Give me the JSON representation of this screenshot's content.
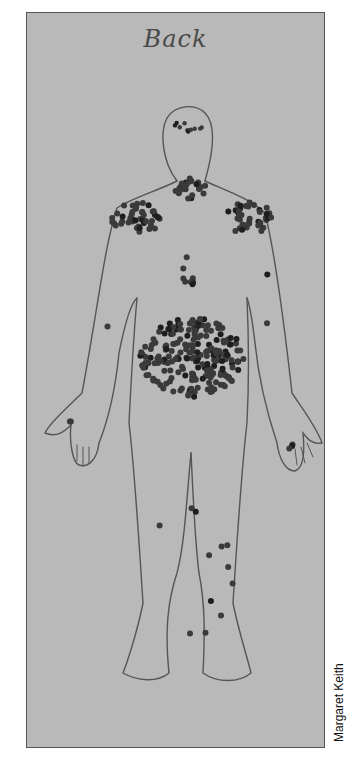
{
  "figure": {
    "title": "Back",
    "credit": "Margaret Keith",
    "colors": {
      "paper": "#b9b9b9",
      "outline": "#555555",
      "dot": "#3a3a3a",
      "dot_dark": "#1e1e1e"
    },
    "dot_clusters": [
      {
        "region": "head",
        "count_estimate": 10
      },
      {
        "region": "neck",
        "count_estimate": 25
      },
      {
        "region": "left-shoulder",
        "count_estimate": 45
      },
      {
        "region": "right-shoulder",
        "count_estimate": 40
      },
      {
        "region": "upper-back-center",
        "count_estimate": 8
      },
      {
        "region": "lower-back",
        "count_estimate": 220
      },
      {
        "region": "left-arm",
        "count_estimate": 1
      },
      {
        "region": "right-arm",
        "count_estimate": 2
      },
      {
        "region": "left-hand",
        "count_estimate": 2
      },
      {
        "region": "right-hand",
        "count_estimate": 3
      },
      {
        "region": "legs",
        "count_estimate": 12
      }
    ]
  }
}
